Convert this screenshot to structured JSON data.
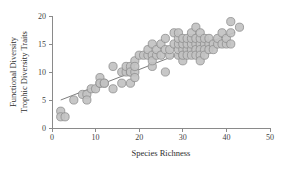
{
  "chart_data": {
    "type": "scatter",
    "title": "",
    "xlabel": "Species Richness",
    "ylabel": "Functional Diversity\nTrophic Diversity Traits",
    "ylabel_lines": [
      "Functional Diversity",
      "Trophic Diversity Traits"
    ],
    "xlim": [
      0,
      50
    ],
    "ylim": [
      0,
      20
    ],
    "xticks": [
      0,
      10,
      20,
      30,
      40,
      50
    ],
    "yticks": [
      0,
      5,
      10,
      15,
      20
    ],
    "xtick_labels": [
      "0",
      "10",
      "20",
      "30",
      "40",
      "50"
    ],
    "ytick_labels": [
      "0",
      "5",
      "10",
      "15",
      "20"
    ],
    "grid": false,
    "legend": null,
    "marker_style": {
      "shape": "circle",
      "fill_color": "#c2c2c2",
      "edge_color": "#8e8e8e",
      "size": 4.1
    },
    "trendline": {
      "type": "linear",
      "color": "#6e6e6e",
      "x_start": 2.0,
      "y_start": 5.0,
      "x_end": 42.0,
      "y_end": 17.1
    },
    "points": [
      [
        2,
        3
      ],
      [
        2,
        2
      ],
      [
        3,
        2
      ],
      [
        5,
        5
      ],
      [
        7,
        6
      ],
      [
        8,
        6
      ],
      [
        8,
        5
      ],
      [
        9,
        7
      ],
      [
        10,
        7
      ],
      [
        11,
        8
      ],
      [
        11,
        9
      ],
      [
        11,
        8
      ],
      [
        12,
        8
      ],
      [
        12,
        8
      ],
      [
        14,
        11
      ],
      [
        14,
        7
      ],
      [
        16,
        8
      ],
      [
        16,
        10
      ],
      [
        17,
        10
      ],
      [
        17,
        11
      ],
      [
        18,
        10
      ],
      [
        18,
        11
      ],
      [
        18,
        10
      ],
      [
        18,
        8
      ],
      [
        19,
        10
      ],
      [
        19,
        12
      ],
      [
        19,
        11
      ],
      [
        19,
        9
      ],
      [
        20,
        13
      ],
      [
        21,
        13
      ],
      [
        22,
        13
      ],
      [
        22,
        14
      ],
      [
        23,
        13
      ],
      [
        23,
        15
      ],
      [
        23,
        11
      ],
      [
        23,
        12
      ],
      [
        24,
        13
      ],
      [
        24,
        14
      ],
      [
        25,
        13
      ],
      [
        25,
        15
      ],
      [
        26,
        16
      ],
      [
        26,
        10
      ],
      [
        26,
        14
      ],
      [
        27,
        13
      ],
      [
        27,
        14
      ],
      [
        28,
        15
      ],
      [
        28,
        17
      ],
      [
        29,
        13
      ],
      [
        29,
        14
      ],
      [
        29,
        15
      ],
      [
        29,
        16
      ],
      [
        29,
        17
      ],
      [
        30,
        13
      ],
      [
        30,
        14
      ],
      [
        30,
        15
      ],
      [
        30,
        16
      ],
      [
        30,
        12
      ],
      [
        30,
        13
      ],
      [
        31,
        14
      ],
      [
        31,
        15
      ],
      [
        31,
        16
      ],
      [
        31,
        13
      ],
      [
        32,
        14
      ],
      [
        32,
        15
      ],
      [
        32,
        16
      ],
      [
        32,
        17
      ],
      [
        32,
        13
      ],
      [
        33,
        15
      ],
      [
        33,
        16
      ],
      [
        33,
        14
      ],
      [
        33,
        13
      ],
      [
        33,
        18
      ],
      [
        34,
        15
      ],
      [
        34,
        16
      ],
      [
        34,
        17
      ],
      [
        34,
        14
      ],
      [
        34,
        13
      ],
      [
        34,
        12
      ],
      [
        35,
        15
      ],
      [
        35,
        16
      ],
      [
        35,
        14
      ],
      [
        35,
        13
      ],
      [
        36,
        15
      ],
      [
        36,
        14
      ],
      [
        36,
        16
      ],
      [
        37,
        15
      ],
      [
        37,
        14
      ],
      [
        38,
        15
      ],
      [
        38,
        16
      ],
      [
        39,
        15
      ],
      [
        39,
        17
      ],
      [
        40,
        15
      ],
      [
        40,
        16
      ],
      [
        41,
        15
      ],
      [
        41,
        19
      ],
      [
        41,
        17
      ],
      [
        43,
        18
      ]
    ]
  }
}
